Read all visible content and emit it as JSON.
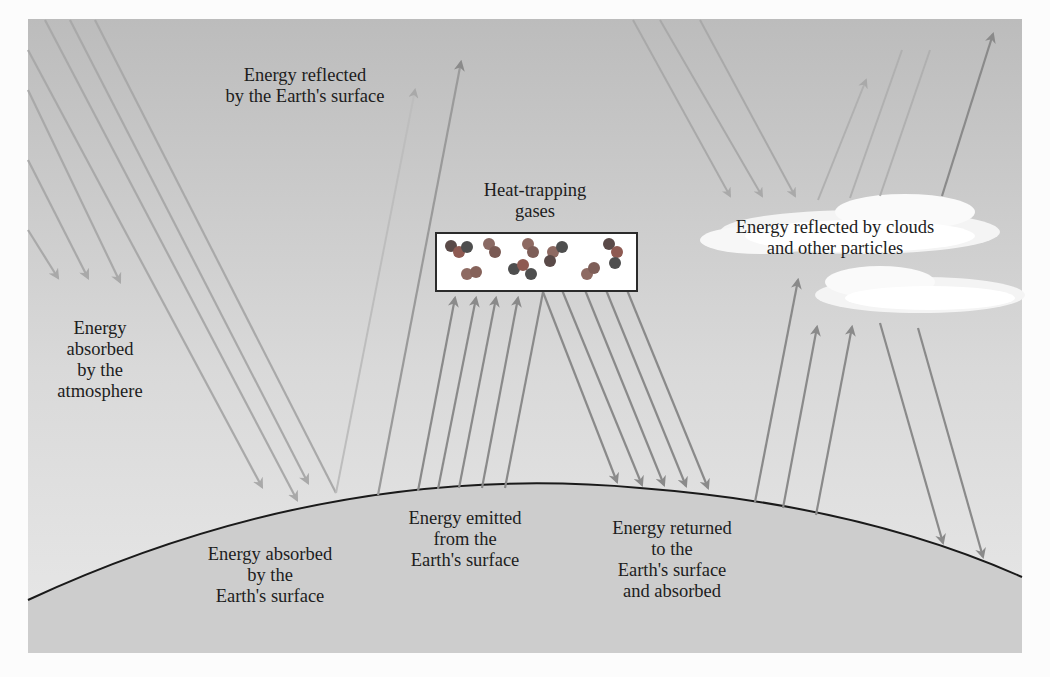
{
  "figure": {
    "colors": {
      "sky_top": "#bdbdbd",
      "sky_bottom": "#e6e6e6",
      "earth": "#cfcfcf",
      "earth_outline": "#1a1a1a",
      "arrow_incoming": "#a9a9a9",
      "arrow_emitted": "#7f7f7f",
      "cloud": "#ffffff",
      "molecule_red": "#8e5a52",
      "molecule_dark": "#4e4e4e",
      "text": "#1d1d1d"
    },
    "labels": {
      "reflected_by_surface": "Energy reflected\nby the Earth's surface",
      "absorbed_by_atmosphere": "Energy\nabsorbed\nby the\natmosphere",
      "heat_trapping_gases": "Heat-trapping\ngases",
      "reflected_by_clouds": "Energy reflected by clouds\nand other particles",
      "absorbed_by_surface": "Energy absorbed\nby the\nEarth's surface",
      "emitted_from_surface": "Energy emitted\nfrom the\nEarth's surface",
      "returned_to_surface": "Energy returned\nto the\nEarth's surface\nand absorbed"
    },
    "caption": ""
  }
}
